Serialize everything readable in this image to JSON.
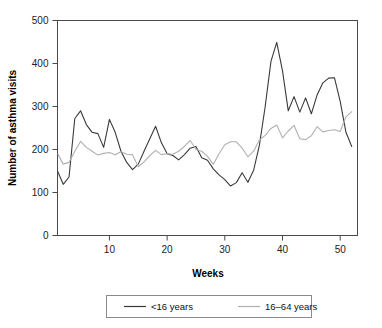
{
  "chart_data": {
    "type": "line",
    "title": "",
    "xlabel": "Weeks",
    "ylabel": "Number of asthma visits",
    "xlim": [
      1,
      53
    ],
    "ylim": [
      0,
      500
    ],
    "xticks": [
      10,
      20,
      30,
      40,
      50
    ],
    "yticks": [
      0,
      100,
      200,
      300,
      400,
      500
    ],
    "grid": false,
    "legend_position": "bottom",
    "x": [
      1,
      2,
      3,
      4,
      5,
      6,
      7,
      8,
      9,
      10,
      11,
      12,
      13,
      14,
      15,
      16,
      17,
      18,
      19,
      20,
      21,
      22,
      23,
      24,
      25,
      26,
      27,
      28,
      29,
      30,
      31,
      32,
      33,
      34,
      35,
      36,
      37,
      38,
      39,
      40,
      41,
      42,
      43,
      44,
      45,
      46,
      47,
      48,
      49,
      50,
      51,
      52
    ],
    "series": [
      {
        "name": "<16 years",
        "color": "#3a3a3a",
        "values": [
          150,
          119,
          136,
          272,
          290,
          258,
          240,
          237,
          205,
          270,
          240,
          196,
          170,
          153,
          166,
          196,
          225,
          254,
          216,
          190,
          186,
          176,
          188,
          203,
          207,
          181,
          175,
          155,
          141,
          130,
          115,
          123,
          146,
          124,
          152,
          210,
          300,
          405,
          449,
          383,
          290,
          323,
          287,
          320,
          283,
          327,
          355,
          366,
          367,
          312,
          240,
          207
        ]
      },
      {
        "name": "16–64 years",
        "color": "#b0b0b0",
        "values": [
          191,
          166,
          170,
          196,
          219,
          205,
          196,
          187,
          191,
          193,
          188,
          195,
          189,
          188,
          160,
          171,
          186,
          198,
          188,
          190,
          189,
          196,
          207,
          221,
          200,
          196,
          184,
          165,
          190,
          211,
          218,
          218,
          203,
          183,
          196,
          222,
          233,
          249,
          257,
          227,
          243,
          256,
          225,
          223,
          232,
          253,
          241,
          244,
          246,
          242,
          276,
          288
        ]
      }
    ],
    "legend_entries": [
      {
        "label": "<16 years",
        "color": "#3a3a3a"
      },
      {
        "label": "16–64 years",
        "color": "#b0b0b0"
      }
    ]
  }
}
